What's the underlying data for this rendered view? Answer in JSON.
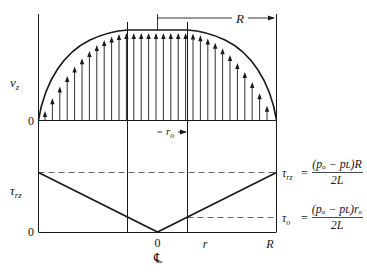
{
  "velocity_plot": {
    "y_label": "v",
    "y_label_sub": "z",
    "zero_label": "0",
    "radius_label": "R",
    "plug_radius_label": "r",
    "plug_radius_sub": "o"
  },
  "stress_plot": {
    "y_label": "τ",
    "y_label_sub": "rz",
    "zero_label": "0",
    "x_tick_center": "0",
    "centerline_symbol": "℄",
    "x_label_r": "r",
    "x_label_R": "R",
    "wall_stress": {
      "lhs": "τ",
      "lhs_sub": "rz",
      "eq": "=",
      "numerator": "(pₒ − pʟ)R",
      "denominator": "2L"
    },
    "yield_stress": {
      "lhs": "τ",
      "lhs_sub": "o",
      "eq": "=",
      "numerator": "(pₒ − pʟ)rₒ",
      "denominator": "2L"
    }
  },
  "colors": {
    "ink": "#1a1a1a",
    "dashed": "#555555"
  }
}
